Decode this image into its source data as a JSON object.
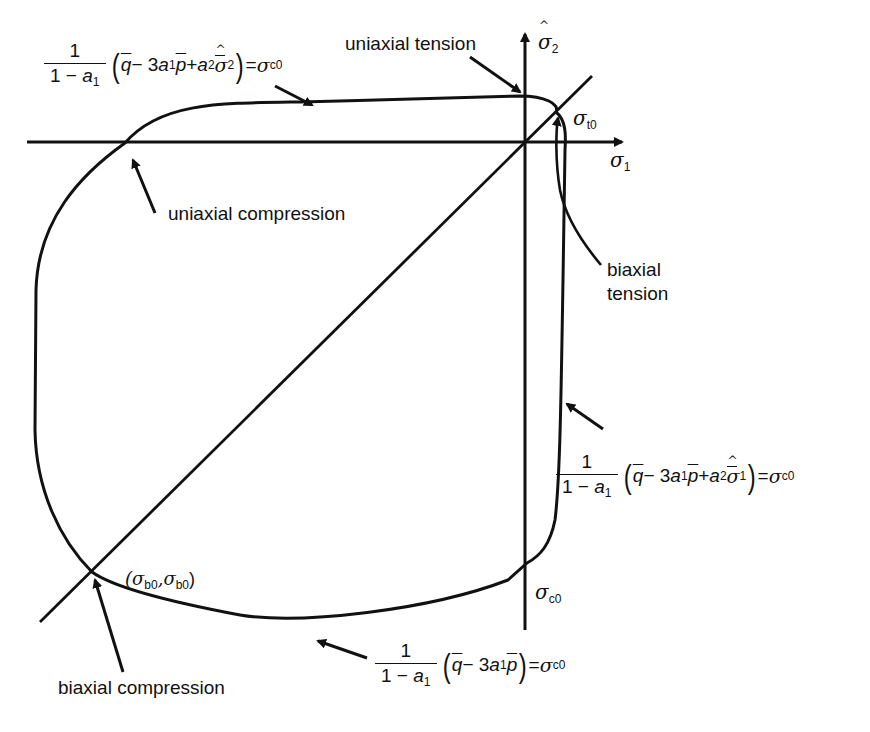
{
  "figure": {
    "axes": {
      "x_label_symbol": "σ",
      "x_label_sub": "1",
      "y_label_symbol": "σ",
      "y_label_sub": "2"
    },
    "labels": {
      "uniaxial_tension": "uniaxial tension",
      "uniaxial_compression": "uniaxial compression",
      "biaxial_tension_line1": "biaxial",
      "biaxial_tension_line2": "tension",
      "biaxial_compression": "biaxial compression",
      "sigma_t0": "σ",
      "sigma_t0_sub": "t0",
      "sigma_c0": "σ",
      "sigma_c0_sub": "c0",
      "sigma_b0_point": "(σ",
      "sigma_b0_sub1": "b0",
      "sigma_b0_mid": ",σ",
      "sigma_b0_sub2": "b0",
      "sigma_b0_close": ")"
    },
    "equations": {
      "top": {
        "num": "1",
        "den_pre": "1 − ",
        "den_var": "a",
        "den_sub": "1",
        "q": "q",
        "minus": " − 3",
        "a1": "a",
        "a1_sub": "1",
        "p": "p",
        "plus": " + ",
        "a2": "a",
        "a2_sub": "2",
        "sig": "σ",
        "sig_sub": "2",
        "equals": " = ",
        "rhs": "σ",
        "rhs_sub": "c0"
      },
      "right": {
        "num": "1",
        "den_pre": "1 − ",
        "den_var": "a",
        "den_sub": "1",
        "q": "q",
        "minus": " − 3",
        "a1": "a",
        "a1_sub": "1",
        "p": "p",
        "plus": " + ",
        "a2": "a",
        "a2_sub": "2",
        "sig": "σ",
        "sig_sub": "1",
        "equals": " = ",
        "rhs": "σ",
        "rhs_sub": "c0"
      },
      "bottom": {
        "num": "1",
        "den_pre": "1 − ",
        "den_var": "a",
        "den_sub": "1",
        "q": "q",
        "minus": " − 3",
        "a1": "a",
        "a1_sub": "1",
        "p": "p",
        "equals": " = ",
        "rhs": "σ",
        "rhs_sub": "c0"
      }
    },
    "colors": {
      "ink": "#111111",
      "background": "#ffffff",
      "bleed_through_text": "#d8d8d8"
    }
  }
}
